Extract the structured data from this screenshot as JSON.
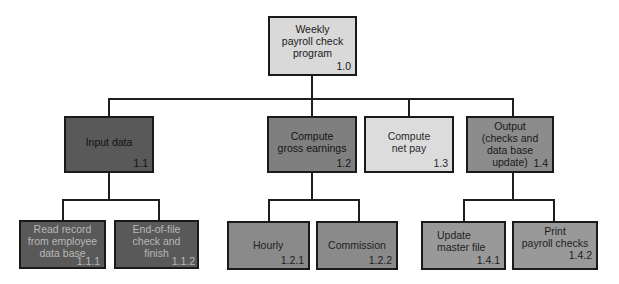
{
  "diagram": {
    "type": "hierarchy-chart",
    "root": {
      "label": "Weekly\npayroll check\nprogram",
      "number": "1.0"
    },
    "level1": [
      {
        "label": "Input data",
        "number": "1.1"
      },
      {
        "label": "Compute\ngross earnings",
        "number": "1.2"
      },
      {
        "label": "Compute\nnet pay",
        "number": "1.3"
      },
      {
        "label": "Output\n(checks and\ndata base update)",
        "number": "1.4"
      }
    ],
    "level2": {
      "input_data": [
        {
          "label": "Read record\nfrom employee\ndata base",
          "number": "1.1.1"
        },
        {
          "label": "End-of-file\ncheck and\nfinish",
          "number": "1.1.2"
        }
      ],
      "compute_gross": [
        {
          "label": "Hourly",
          "number": "1.2.1"
        },
        {
          "label": "Commission",
          "number": "1.2.2"
        }
      ],
      "output": [
        {
          "label": "Update\nmaster file",
          "number": "1.4.1"
        },
        {
          "label": "Print\npayroll checks",
          "number": "1.4.2"
        }
      ]
    },
    "colors": {
      "line": "#1e1e1e",
      "root_fill": "#d9d9d9",
      "input_fill": "#595959",
      "gross_fill": "#7f7f7f",
      "net_fill": "#dcdcdc",
      "output_fill": "#8c8c8c"
    }
  }
}
